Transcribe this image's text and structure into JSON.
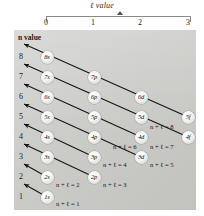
{
  "figure": {
    "type": "diagram",
    "name": "aufbau-madelung-diagram",
    "x_axis": {
      "title": "ℓ value",
      "title_italic_symbol": "ℓ",
      "ticks": [
        "0",
        "1",
        "2",
        "3"
      ]
    },
    "y_axis": {
      "title": "n value",
      "ticks": [
        "8",
        "7",
        "6",
        "5",
        "4",
        "3",
        "2",
        "1"
      ]
    },
    "orbitals": [
      {
        "label": "8s",
        "n": 8,
        "l": 0
      },
      {
        "label": "7s",
        "n": 7,
        "l": 0
      },
      {
        "label": "7p",
        "n": 7,
        "l": 1
      },
      {
        "label": "6s",
        "n": 6,
        "l": 0
      },
      {
        "label": "6p",
        "n": 6,
        "l": 1
      },
      {
        "label": "6d",
        "n": 6,
        "l": 2
      },
      {
        "label": "5s",
        "n": 5,
        "l": 0
      },
      {
        "label": "5p",
        "n": 5,
        "l": 1
      },
      {
        "label": "5d",
        "n": 5,
        "l": 2
      },
      {
        "label": "5f",
        "n": 5,
        "l": 3
      },
      {
        "label": "4s",
        "n": 4,
        "l": 0
      },
      {
        "label": "4p",
        "n": 4,
        "l": 1
      },
      {
        "label": "4d",
        "n": 4,
        "l": 2
      },
      {
        "label": "4f",
        "n": 4,
        "l": 3
      },
      {
        "label": "3s",
        "n": 3,
        "l": 0
      },
      {
        "label": "3p",
        "n": 3,
        "l": 1
      },
      {
        "label": "3d",
        "n": 3,
        "l": 2
      },
      {
        "label": "2s",
        "n": 2,
        "l": 0
      },
      {
        "label": "2p",
        "n": 2,
        "l": 1
      },
      {
        "label": "1s",
        "n": 1,
        "l": 0
      }
    ],
    "diagonals": [
      {
        "sum_label": "n + ℓ = 1",
        "sum": 1
      },
      {
        "sum_label": "n + ℓ = 2",
        "sum": 2
      },
      {
        "sum_label": "n + ℓ = 3",
        "sum": 3
      },
      {
        "sum_label": "n + ℓ = 4",
        "sum": 4
      },
      {
        "sum_label": "n + ℓ = 5",
        "sum": 5
      },
      {
        "sum_label": "n + ℓ = 6",
        "sum": 6
      },
      {
        "sum_label": "n + ℓ = 7",
        "sum": 7
      },
      {
        "sum_label": "n + ℓ = 8",
        "sum": 8
      }
    ],
    "colors": {
      "panel": "#cbcbc8",
      "bubble": "#f2f2f0",
      "arrow": "#1a1a1a",
      "text": "#16161a",
      "page": "#ffffff"
    }
  }
}
